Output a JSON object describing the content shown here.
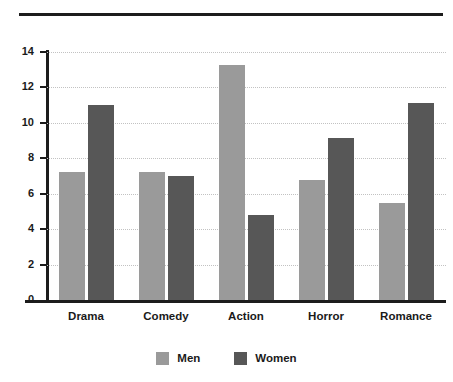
{
  "chart_data": {
    "type": "bar",
    "title": "",
    "xlabel": "",
    "ylabel": "",
    "ylim": [
      0,
      14
    ],
    "ytick_step": 2,
    "yticks": [
      0,
      2,
      4,
      6,
      8,
      10,
      12,
      14
    ],
    "grid": true,
    "legend_position": "bottom-center",
    "categories": [
      "Drama",
      "Comedy",
      "Action",
      "Horror",
      "Romance"
    ],
    "series": [
      {
        "name": "Men",
        "color": "#9a9a9a",
        "values": [
          7.25,
          7.25,
          13.25,
          6.75,
          5.45
        ]
      },
      {
        "name": "Women",
        "color": "#575757",
        "values": [
          11.0,
          7.0,
          4.8,
          9.15,
          11.1
        ]
      }
    ]
  },
  "legend": {
    "items": [
      {
        "label": "Men"
      },
      {
        "label": "Women"
      }
    ]
  },
  "colors": {
    "men": "#9a9a9a",
    "women": "#575757",
    "axis": "#1c1c1c",
    "grid": "#c2c2c2",
    "background": "#ffffff"
  }
}
